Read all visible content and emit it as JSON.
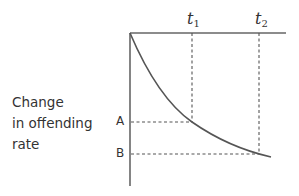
{
  "diagram": {
    "y_axis_label": [
      "Change",
      "in offending",
      "rate"
    ],
    "y_ticks": [
      {
        "label": "A"
      },
      {
        "label": "B"
      }
    ],
    "time_markers": [
      {
        "symbol": "t",
        "subscript": "1"
      },
      {
        "symbol": "t",
        "subscript": "2"
      }
    ],
    "colors": {
      "line": "#555555",
      "text": "#333333",
      "background": "#ffffff"
    }
  }
}
